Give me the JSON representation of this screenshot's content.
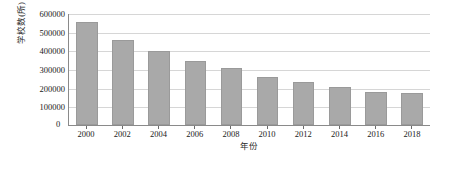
{
  "chart_data": {
    "type": "bar",
    "title": "",
    "subtitle": "",
    "xlabel": "年份",
    "ylabel": "学校数(所)",
    "categories": [
      "2000",
      "2002",
      "2004",
      "2006",
      "2008",
      "2010",
      "2012",
      "2014",
      "2016",
      "2018"
    ],
    "values": [
      553000,
      457000,
      394000,
      342000,
      303000,
      258000,
      229000,
      201000,
      177000,
      172000
    ],
    "series": [
      {
        "name": "学校数(所)",
        "values": [
          553000,
          457000,
          394000,
          342000,
          303000,
          258000,
          229000,
          201000,
          177000,
          172000
        ]
      }
    ],
    "ylim": [
      0,
      600000
    ],
    "yticks": [
      0,
      100000,
      200000,
      300000,
      400000,
      500000,
      600000
    ],
    "ytick_labels": [
      "0",
      "100000",
      "200000",
      "300000",
      "400000",
      "500000",
      "600000"
    ],
    "grid": "horizontal",
    "legend": "none",
    "bar_color": "#a9a9a9",
    "bar_edge_color": "#9a9a9a",
    "gridline_color": "#d6d6d6",
    "axis_color": "#8a8a8a",
    "background_color": "#ffffff",
    "text_color": "#1a1a1a"
  },
  "axes": {
    "y_title": "学校数(所)",
    "x_title": "年份",
    "origin_label": "0"
  }
}
